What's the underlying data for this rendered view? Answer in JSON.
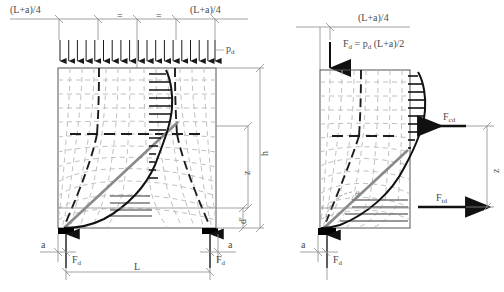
{
  "figure": {
    "type": "engineering-diagram",
    "colors": {
      "dimension_line": "#8c8c8c",
      "crack_dashed": "#b4b4b4",
      "strut_bold": "#1a1a1a",
      "stress_curve": "#111111",
      "tie_gray": "#8a8a8a",
      "support_black": "#000000",
      "text": "#4a4a4a"
    }
  },
  "left_panel": {
    "name": "stress-field-diagram",
    "top_dimension": {
      "left_label": "(L+a)/4",
      "right_label": "(L+a)/4",
      "equal_marks": [
        "=",
        "="
      ]
    },
    "load": {
      "label_main": "p",
      "label_sub": "d",
      "arrow_count": 19,
      "direction": "down"
    },
    "vertical_dimensions": {
      "h": "h",
      "z": "z",
      "d_prime": "d'"
    },
    "supports": {
      "left_edge_label": "a",
      "right_edge_label": "a",
      "left_reaction_main": "F",
      "left_reaction_sub": "d",
      "right_reaction_main": "F",
      "right_reaction_sub": "d"
    },
    "span_label": "L"
  },
  "right_panel": {
    "name": "strut-and-tie-model",
    "top_dimension": {
      "label": "(L+a)/4"
    },
    "resultant_force": {
      "text": "F",
      "sub1": "d",
      "eq": " = p",
      "sub2": "d",
      "tail": " (L+a)/2",
      "full": "Fd = pd (L+a)/2"
    },
    "compression": {
      "label_main": "F",
      "label_sub": "cd",
      "direction": "left"
    },
    "tension": {
      "label_main": "F",
      "label_sub": "td",
      "direction": "right"
    },
    "lever_arm": "z",
    "support": {
      "edge_label": "a",
      "reaction_main": "F",
      "reaction_sub": "d"
    },
    "angle_symbol": "θ"
  }
}
